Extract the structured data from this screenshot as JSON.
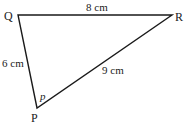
{
  "diagram": {
    "type": "triangle",
    "vertices": {
      "Q": {
        "label": "Q",
        "x": 18,
        "y": 15
      },
      "R": {
        "label": "R",
        "x": 172,
        "y": 15
      },
      "P": {
        "label": "P",
        "x": 37,
        "y": 108
      }
    },
    "sides": {
      "QR": {
        "label": "8 cm"
      },
      "QP": {
        "label": "6 cm"
      },
      "PR": {
        "label": "9 cm"
      }
    },
    "angle": {
      "at": "P",
      "label": "p"
    },
    "line_color": "#1a1a1a"
  }
}
